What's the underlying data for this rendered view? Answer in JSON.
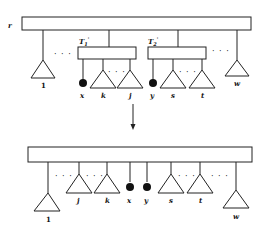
{
  "diagram": {
    "before": {
      "root_label": "r",
      "subtree_labels": [
        "T'1",
        "T'2"
      ],
      "leaves": [
        "1",
        "x",
        "k",
        "j",
        "y",
        "s",
        "t",
        "w"
      ],
      "ellipsis": "..."
    },
    "after": {
      "leaves": [
        "1",
        "j",
        "k",
        "x",
        "y",
        "s",
        "t",
        "w"
      ],
      "ellipsis": "..."
    },
    "labels": {
      "r": "r",
      "T1": "T",
      "T1_sub": "1",
      "T1_sup": "'",
      "T2": "T",
      "T2_sub": "2",
      "T2_sup": "'",
      "one": "1",
      "x": "x",
      "k": "k",
      "j": "j",
      "y": "y",
      "s": "s",
      "t": "t",
      "w": "w",
      "dots": "· · ·"
    },
    "colors": {
      "stroke": "#222222",
      "fill_dot": "#111111",
      "background": "#ffffff"
    }
  }
}
